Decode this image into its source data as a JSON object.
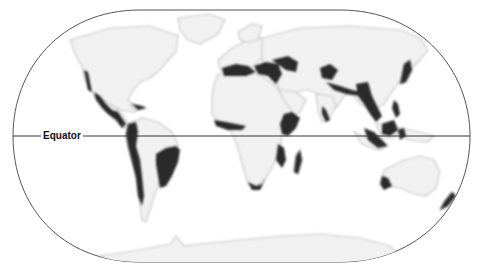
{
  "map": {
    "projection": "world (rounded/pill frame)",
    "equator_label": "Equator",
    "colors": {
      "land": "#f1f1f1",
      "land_edge": "#c9c9c9",
      "highlight": "#2a2a2a",
      "frame": "#555555",
      "equator_line": "#333333",
      "background": "#ffffff"
    },
    "highlighted_regions": [
      "California coast",
      "Mexico / Central America",
      "Caribbean islands",
      "Tropical Andes",
      "Chilean coast",
      "Brazilian Atlantic Forest / Cerrado",
      "Mediterranean Basin",
      "Caucasus / Irano-Anatolian",
      "Horn of Africa",
      "Eastern Afromontane / Coastal East Africa",
      "West African forests",
      "Cape region (South Africa)",
      "Madagascar",
      "Mountains of Central Asia",
      "Himalaya",
      "Western Ghats / Sri Lanka",
      "Indo-Burma",
      "Southwest China mountains",
      "Japan",
      "Philippines",
      "Sundaland",
      "Wallacea",
      "Southwest Australia",
      "New Zealand"
    ],
    "top_caption_clipped": true
  }
}
